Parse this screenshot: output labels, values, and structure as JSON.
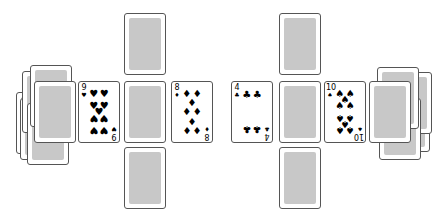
{
  "game": {
    "type": "card table",
    "left_pile": {
      "label": "",
      "face": "down"
    },
    "right_pile": {
      "label": "",
      "face": "down"
    },
    "left_column": {
      "cards": [
        "back",
        "back",
        "back"
      ]
    },
    "right_column": {
      "cards": [
        "back",
        "back",
        "back"
      ]
    },
    "face_up_cards": [
      {
        "rank": "9",
        "suit": "♥",
        "suit_name": "hearts",
        "position": "left-inner"
      },
      {
        "rank": "8",
        "suit": "♦",
        "suit_name": "diamonds",
        "position": "center-left"
      },
      {
        "rank": "4",
        "suit": "♣",
        "suit_name": "clubs",
        "position": "center-right"
      },
      {
        "rank": "10",
        "suit": "♠",
        "suit_name": "spades",
        "position": "right-inner"
      }
    ]
  },
  "colors": {
    "background": "#ffffff",
    "card_border": "#555555",
    "card_back": "#c8c8c8"
  }
}
